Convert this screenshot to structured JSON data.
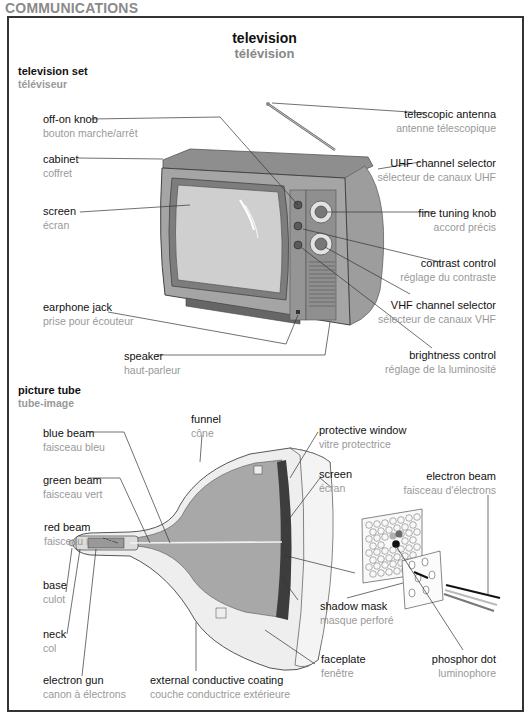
{
  "section_header": "COMMUNICATIONS",
  "title": {
    "en": "television",
    "fr": "télévision"
  },
  "television_set": {
    "heading": {
      "en": "television set",
      "fr": "téléviseur"
    },
    "labels": [
      {
        "id": "off-on-knob",
        "en": "off-on knob",
        "fr": "bouton marche/arrêt"
      },
      {
        "id": "cabinet",
        "en": "cabinet",
        "fr": "coffret"
      },
      {
        "id": "screen",
        "en": "screen",
        "fr": "écran"
      },
      {
        "id": "earphone-jack",
        "en": "earphone jack",
        "fr": "prise pour écouteur"
      },
      {
        "id": "speaker",
        "en": "speaker",
        "fr": "haut-parleur"
      },
      {
        "id": "telescopic-antenna",
        "en": "telescopic antenna",
        "fr": "antenne télescopique"
      },
      {
        "id": "uhf-channel-selector",
        "en": "UHF channel selector",
        "fr": "sélecteur de canaux UHF"
      },
      {
        "id": "fine-tuning-knob",
        "en": "fine tuning knob",
        "fr": "accord précis"
      },
      {
        "id": "contrast-control",
        "en": "contrast control",
        "fr": "réglage du contraste"
      },
      {
        "id": "vhf-channel-selector",
        "en": "VHF channel selector",
        "fr": "sélecteur de canaux VHF"
      },
      {
        "id": "brightness-control",
        "en": "brightness control",
        "fr": "réglage de la luminosité"
      }
    ]
  },
  "picture_tube": {
    "heading": {
      "en": "picture tube",
      "fr": "tube-image"
    },
    "labels": [
      {
        "id": "blue-beam",
        "en": "blue beam",
        "fr": "faisceau bleu"
      },
      {
        "id": "green-beam",
        "en": "green beam",
        "fr": "faisceau vert"
      },
      {
        "id": "red-beam",
        "en": "red beam",
        "fr": "faisceau rouge"
      },
      {
        "id": "base",
        "en": "base",
        "fr": "culot"
      },
      {
        "id": "neck",
        "en": "neck",
        "fr": "col"
      },
      {
        "id": "electron-gun",
        "en": "electron gun",
        "fr": "canon à électrons"
      },
      {
        "id": "funnel",
        "en": "funnel",
        "fr": "cône"
      },
      {
        "id": "external-conductive-coating",
        "en": "external conductive coating",
        "fr": "couche conductrice extérieure"
      },
      {
        "id": "protective-window",
        "en": "protective window",
        "fr": "vitre protectrice"
      },
      {
        "id": "tube-screen",
        "en": "screen",
        "fr": "écran"
      },
      {
        "id": "shadow-mask",
        "en": "shadow mask",
        "fr": "masque perforé"
      },
      {
        "id": "faceplate",
        "en": "faceplate",
        "fr": "fenêtre"
      },
      {
        "id": "electron-beam",
        "en": "electron beam",
        "fr": "faisceau d'électrons"
      },
      {
        "id": "phosphor-dot",
        "en": "phosphor dot",
        "fr": "luminophore"
      }
    ]
  },
  "colors": {
    "label_en": "#111111",
    "label_fr": "#999999",
    "header_gray": "#8a8a8a",
    "tv_body": "#9a9a9a",
    "screen_gray": "#c8c8c8",
    "tube_interior": "#a8a8a8"
  }
}
